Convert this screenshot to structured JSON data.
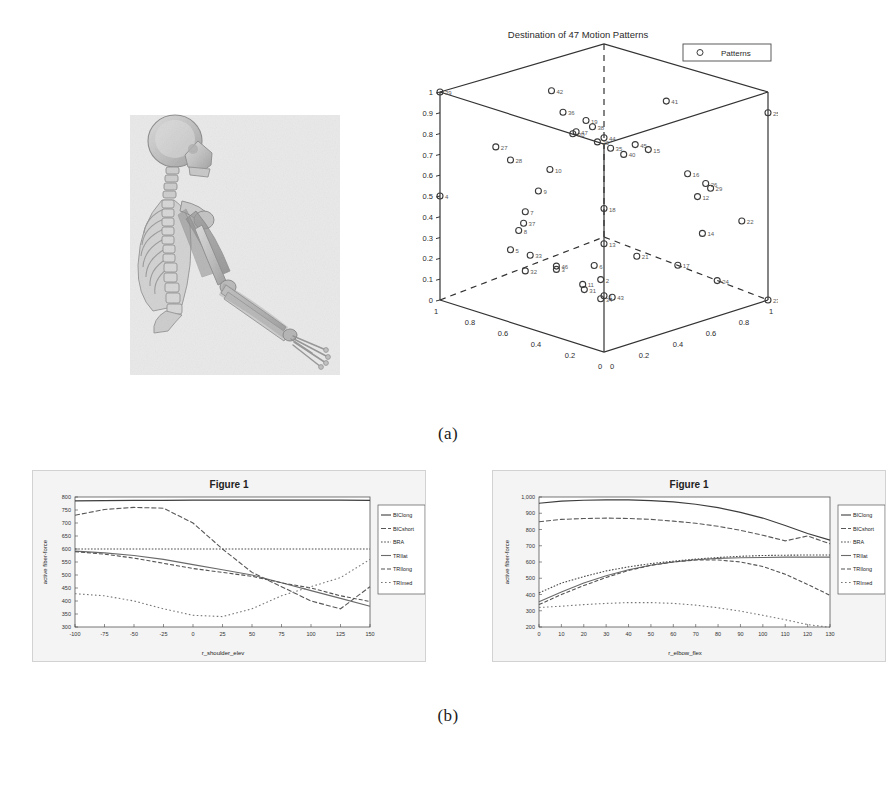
{
  "document": {
    "captions": {
      "a": "(a)",
      "b": "(b)"
    }
  },
  "panel_a": {
    "skeleton": {
      "name": "musculoskeletal-arm-model",
      "description": "Grayscale anatomical rendering of human upper body skeleton with extended right arm and upper-limb musculature"
    },
    "scatter3d": {
      "title": "Destination of 47 Motion Patterns",
      "legend": {
        "label": "Patterns",
        "marker": "circle-marker"
      },
      "axes": {
        "x_ticks": [
          "0",
          "0.2",
          "0.4",
          "0.6",
          "0.8",
          "1"
        ],
        "y_ticks": [
          "1",
          "0.8",
          "0.6",
          "0.4",
          "0.2",
          "0"
        ],
        "z_ticks": [
          "0",
          "0.1",
          "0.2",
          "0.3",
          "0.4",
          "0.5",
          "0.6",
          "0.7",
          "0.8",
          "0.9",
          "1"
        ],
        "x_origin_label": "0",
        "y_origin_label": "1",
        "z_origin_label": "0"
      }
    }
  },
  "panel_b": {
    "left_figure": {
      "window_title": "Figure 1",
      "legend_entries": [
        "BIClong",
        "BICshort",
        "BRA",
        "TRIlat",
        "TRIlong",
        "TRImed"
      ]
    },
    "right_figure": {
      "window_title": "Figure 1",
      "legend_entries": [
        "BIClong",
        "BICshort",
        "BRA",
        "TRIlat",
        "TRIlong",
        "TRImed"
      ]
    }
  },
  "chart_data": [
    {
      "id": "scatter3d-motion-patterns",
      "type": "scatter",
      "title": "Destination of 47 Motion Patterns",
      "xlabel": "",
      "ylabel": "",
      "zlabel": "",
      "xlim": [
        0,
        1
      ],
      "ylim": [
        0,
        1
      ],
      "zlim": [
        0,
        1
      ],
      "grid": false,
      "legend": [
        "Patterns"
      ],
      "legend_position": "outside-top-right",
      "projection": "3d-box",
      "n_points": 47,
      "points": [
        {
          "label": "1",
          "x": 0.5,
          "y": 0.5,
          "z": 0.02
        },
        {
          "label": "2",
          "x": 0.46,
          "y": 0.48,
          "z": 0.08
        },
        {
          "label": "3",
          "x": 0.31,
          "y": 0.6,
          "z": 0.12
        },
        {
          "label": "4",
          "x": 0.0,
          "y": 1.0,
          "z": 0.5
        },
        {
          "label": "5",
          "x": 0.18,
          "y": 0.75,
          "z": 0.22
        },
        {
          "label": "6",
          "x": 0.46,
          "y": 0.52,
          "z": 0.16
        },
        {
          "label": "7",
          "x": 0.22,
          "y": 0.7,
          "z": 0.4
        },
        {
          "label": "8",
          "x": 0.2,
          "y": 0.72,
          "z": 0.31
        },
        {
          "label": "9",
          "x": 0.26,
          "y": 0.66,
          "z": 0.5
        },
        {
          "label": "10",
          "x": 0.29,
          "y": 0.62,
          "z": 0.6
        },
        {
          "label": "11",
          "x": 0.41,
          "y": 0.54,
          "z": 0.06
        },
        {
          "label": "12",
          "x": 0.79,
          "y": 0.22,
          "z": 0.5
        },
        {
          "label": "13",
          "x": 0.5,
          "y": 0.5,
          "z": 0.27
        },
        {
          "label": "14",
          "x": 0.8,
          "y": 0.2,
          "z": 0.32
        },
        {
          "label": "15",
          "x": 0.63,
          "y": 0.36,
          "z": 0.72
        },
        {
          "label": "16",
          "x": 0.76,
          "y": 0.25,
          "z": 0.61
        },
        {
          "label": "17",
          "x": 0.73,
          "y": 0.28,
          "z": 0.17
        },
        {
          "label": "18",
          "x": 0.5,
          "y": 0.5,
          "z": 0.44
        },
        {
          "label": "19",
          "x": 0.44,
          "y": 0.55,
          "z": 0.86
        },
        {
          "label": "20",
          "x": 0.48,
          "y": 0.52,
          "z": 0.76
        },
        {
          "label": "21",
          "x": 0.6,
          "y": 0.4,
          "z": 0.21
        },
        {
          "label": "22",
          "x": 0.92,
          "y": 0.08,
          "z": 0.38
        },
        {
          "label": "23",
          "x": 1.0,
          "y": 0.0,
          "z": 0.0
        },
        {
          "label": "24",
          "x": 0.84,
          "y": 0.15,
          "z": 0.09
        },
        {
          "label": "25",
          "x": 1.0,
          "y": 0.0,
          "z": 0.9
        },
        {
          "label": "26",
          "x": 0.81,
          "y": 0.19,
          "z": 0.56
        },
        {
          "label": "27",
          "x": 0.16,
          "y": 0.82,
          "z": 0.73
        },
        {
          "label": "28",
          "x": 0.21,
          "y": 0.78,
          "z": 0.67
        },
        {
          "label": "29",
          "x": 0.83,
          "y": 0.18,
          "z": 0.54
        },
        {
          "label": "30",
          "x": 0.39,
          "y": 0.58,
          "z": 0.79
        },
        {
          "label": "31",
          "x": 0.44,
          "y": 0.56,
          "z": 0.05
        },
        {
          "label": "32",
          "x": 0.26,
          "y": 0.74,
          "z": 0.14
        },
        {
          "label": "33",
          "x": 0.25,
          "y": 0.7,
          "z": 0.2
        },
        {
          "label": "34",
          "x": 0.48,
          "y": 0.5,
          "z": 0.0
        },
        {
          "label": "35",
          "x": 0.52,
          "y": 0.48,
          "z": 0.73
        },
        {
          "label": "36",
          "x": 0.37,
          "y": 0.62,
          "z": 0.9
        },
        {
          "label": "37",
          "x": 0.24,
          "y": 0.73,
          "z": 0.36
        },
        {
          "label": "38",
          "x": 0.46,
          "y": 0.53,
          "z": 0.83
        },
        {
          "label": "39",
          "x": 0.0,
          "y": 1.0,
          "z": 1.0
        },
        {
          "label": "40",
          "x": 0.56,
          "y": 0.44,
          "z": 0.7
        },
        {
          "label": "41",
          "x": 0.68,
          "y": 0.3,
          "z": 0.95
        },
        {
          "label": "42",
          "x": 0.33,
          "y": 0.65,
          "z": 1.0
        },
        {
          "label": "43",
          "x": 0.52,
          "y": 0.47,
          "z": 0.01
        },
        {
          "label": "44",
          "x": 0.5,
          "y": 0.5,
          "z": 0.78
        },
        {
          "label": "45",
          "x": 0.6,
          "y": 0.41,
          "z": 0.75
        },
        {
          "label": "46",
          "x": 0.35,
          "y": 0.64,
          "z": 0.16
        },
        {
          "label": "47",
          "x": 0.4,
          "y": 0.57,
          "z": 0.8
        }
      ]
    },
    {
      "id": "figure1-shoulder-elevation",
      "type": "line",
      "title": "Figure 1",
      "xlabel": "r_shoulder_elev",
      "ylabel": "active fiber-force",
      "xlim": [
        -100,
        150
      ],
      "ylim": [
        300,
        800
      ],
      "x_ticks": [
        -100,
        -75,
        -50,
        -25,
        0,
        25,
        50,
        75,
        100,
        125,
        150
      ],
      "y_ticks": [
        300,
        350,
        400,
        450,
        500,
        550,
        600,
        650,
        700,
        750,
        800
      ],
      "grid": false,
      "legend_position": "outside-right",
      "x": [
        -100,
        -75,
        -50,
        -25,
        0,
        25,
        50,
        75,
        100,
        125,
        150
      ],
      "series": [
        {
          "name": "BIClong",
          "values": [
            785,
            786,
            787,
            787,
            788,
            788,
            788,
            788,
            788,
            788,
            787
          ]
        },
        {
          "name": "BICshort",
          "values": [
            730,
            752,
            760,
            757,
            700,
            600,
            510,
            455,
            400,
            370,
            455
          ]
        },
        {
          "name": "BRA",
          "values": [
            600,
            600,
            600,
            600,
            600,
            600,
            600,
            600,
            600,
            600,
            600
          ]
        },
        {
          "name": "TRIlat",
          "values": [
            592,
            585,
            575,
            560,
            540,
            520,
            500,
            470,
            440,
            410,
            380
          ]
        },
        {
          "name": "TRIlong",
          "values": [
            590,
            580,
            565,
            545,
            525,
            510,
            495,
            470,
            450,
            420,
            398
          ]
        },
        {
          "name": "TRImed",
          "values": [
            428,
            420,
            400,
            370,
            345,
            340,
            370,
            420,
            455,
            490,
            560
          ]
        }
      ]
    },
    {
      "id": "figure1-elbow-flexion",
      "type": "line",
      "title": "Figure 1",
      "xlabel": "r_elbow_flex",
      "ylabel": "active fiber-force",
      "xlim": [
        0,
        130
      ],
      "ylim": [
        200,
        1000
      ],
      "x_ticks": [
        0,
        10,
        20,
        30,
        40,
        50,
        60,
        70,
        80,
        90,
        100,
        110,
        120,
        130
      ],
      "y_ticks": [
        200,
        300,
        400,
        500,
        600,
        700,
        800,
        900,
        1000
      ],
      "grid": false,
      "legend_position": "outside-right",
      "x": [
        0,
        10,
        20,
        30,
        40,
        50,
        60,
        70,
        80,
        90,
        100,
        110,
        120,
        130
      ],
      "series": [
        {
          "name": "BIClong",
          "values": [
            962,
            975,
            980,
            982,
            982,
            978,
            970,
            955,
            935,
            905,
            870,
            825,
            775,
            735
          ]
        },
        {
          "name": "BICshort",
          "values": [
            848,
            862,
            868,
            870,
            868,
            862,
            852,
            838,
            820,
            795,
            765,
            730,
            760,
            712
          ]
        },
        {
          "name": "BRA",
          "values": [
            410,
            470,
            510,
            545,
            570,
            590,
            605,
            618,
            628,
            635,
            640,
            642,
            643,
            643
          ]
        },
        {
          "name": "TRIlat",
          "values": [
            355,
            415,
            470,
            515,
            552,
            580,
            600,
            614,
            622,
            626,
            628,
            630,
            630,
            630
          ]
        },
        {
          "name": "TRIlong",
          "values": [
            338,
            400,
            455,
            505,
            548,
            580,
            600,
            612,
            612,
            600,
            572,
            525,
            462,
            395
          ]
        },
        {
          "name": "TRImed",
          "values": [
            320,
            328,
            338,
            345,
            350,
            350,
            345,
            335,
            318,
            298,
            272,
            245,
            215,
            198
          ]
        }
      ]
    }
  ]
}
